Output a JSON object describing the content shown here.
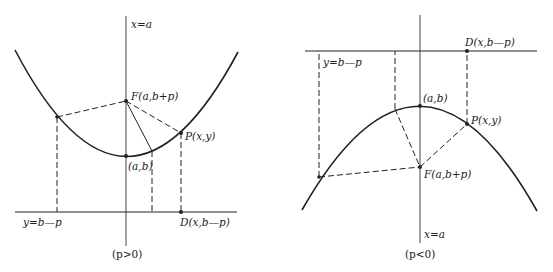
{
  "diagrams": [
    {
      "id": "left",
      "caption": "(p>0)",
      "labels": {
        "axis": "x=a",
        "focus": "F(a,b+p)",
        "vertex": "(a,b)",
        "point": "P(x,y)",
        "directrix": "y=b—p",
        "directrix_point": "D(x,b—p)"
      },
      "orientation": "opens upward"
    },
    {
      "id": "right",
      "caption": "(p<0)",
      "labels": {
        "axis": "x=a",
        "focus": "F(a,b+p)",
        "vertex": "(a,b)",
        "point": "P(x,y)",
        "directrix": "y=b—p",
        "directrix_point": "D(x,b—p)"
      },
      "orientation": "opens downward"
    }
  ],
  "colors": {
    "ink": "#222222",
    "background": "#ffffff"
  }
}
